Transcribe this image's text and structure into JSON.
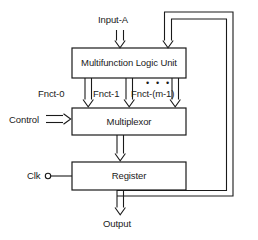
{
  "diagram": {
    "title_text": "",
    "stroke_color": "#1a1a1a",
    "fill_color": "#ffffff",
    "blocks": [
      {
        "id": "mlu",
        "label": "Multifunction Logic Unit",
        "x": 72,
        "y": 48,
        "w": 114,
        "h": 30
      },
      {
        "id": "mux",
        "label": "Multiplexor",
        "x": 72,
        "y": 108,
        "w": 114,
        "h": 27
      },
      {
        "id": "reg",
        "label": "Register",
        "x": 72,
        "y": 162,
        "w": 114,
        "h": 28
      }
    ],
    "signals": {
      "input_a": "Input-A",
      "control": "Control",
      "clk": "Clk",
      "output": "Output",
      "fnct_0": "Fnct-0",
      "fnct_1": "Fnct-1",
      "fnct_m1": "Fnct-(m-1)",
      "ellipsis": "• • •"
    }
  }
}
